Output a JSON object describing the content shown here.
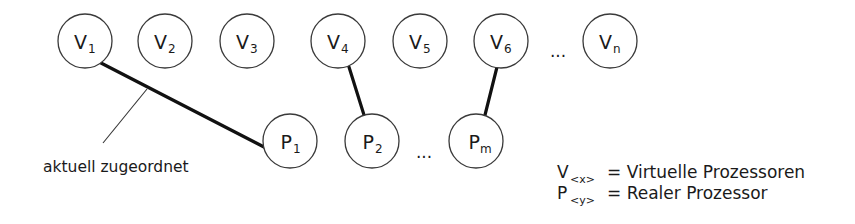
{
  "diagram": {
    "type": "assignment-graph",
    "virtual_processors": [
      {
        "id": "V1",
        "letter": "V",
        "sub": "1",
        "cx": 85,
        "cy": 41
      },
      {
        "id": "V2",
        "letter": "V",
        "sub": "2",
        "cx": 165,
        "cy": 41
      },
      {
        "id": "V3",
        "letter": "V",
        "sub": "3",
        "cx": 247,
        "cy": 41
      },
      {
        "id": "V4",
        "letter": "V",
        "sub": "4",
        "cx": 338,
        "cy": 41
      },
      {
        "id": "V5",
        "letter": "V",
        "sub": "5",
        "cx": 420,
        "cy": 41
      },
      {
        "id": "V6",
        "letter": "V",
        "sub": "6",
        "cx": 501,
        "cy": 41
      },
      {
        "id": "Vn",
        "letter": "V",
        "sub": "n",
        "cx": 610,
        "cy": 41
      }
    ],
    "real_processors": [
      {
        "id": "P1",
        "letter": "P",
        "sub": "1",
        "cx": 290,
        "cy": 141
      },
      {
        "id": "P2",
        "letter": "P",
        "sub": "2",
        "cx": 372,
        "cy": 141
      },
      {
        "id": "Pm",
        "letter": "P",
        "sub": "m",
        "cx": 476,
        "cy": 141
      }
    ],
    "ellipsis_top": "...",
    "ellipsis_bottom": "...",
    "edges": [
      {
        "from": "V1",
        "to": "P1"
      },
      {
        "from": "V4",
        "to": "P2"
      },
      {
        "from": "V6",
        "to": "Pm"
      }
    ],
    "annotation": {
      "label": "aktuell zugeordnet",
      "points_to_edge": "V1-P1"
    },
    "legend": [
      {
        "symbol": "V",
        "sub": "<x>",
        "text": "= Virtuelle Prozessoren"
      },
      {
        "symbol": "P",
        "sub": "<y>",
        "text": "= Realer Prozessor"
      }
    ]
  }
}
